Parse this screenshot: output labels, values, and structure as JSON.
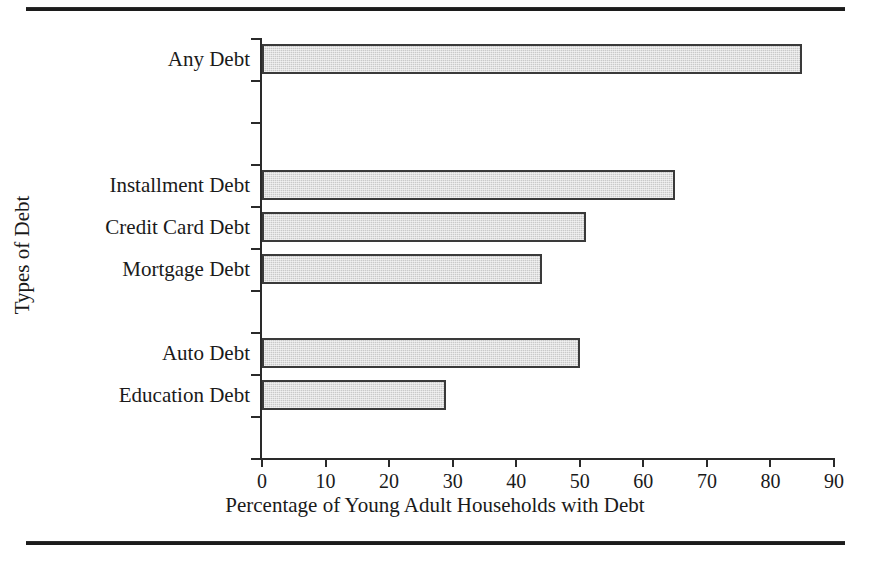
{
  "figure": {
    "top_rule": "",
    "bottom_rule": ""
  },
  "chart_data": {
    "type": "bar",
    "orientation": "horizontal",
    "title": "",
    "xlabel": "Percentage of Young Adult Households with Debt",
    "ylabel": "Types of Debt",
    "categories": [
      "Any Debt",
      "Installment Debt",
      "Credit Card Debt",
      "Mortgage Debt",
      "Auto Debt",
      "Education Debt"
    ],
    "values": [
      85,
      65,
      51,
      44,
      50,
      29
    ],
    "xlim": [
      0,
      90
    ],
    "xticks": [
      0,
      10,
      20,
      30,
      40,
      50,
      60,
      70,
      80,
      90
    ],
    "xtick_labels": [
      "0",
      "10",
      "20",
      "30",
      "40",
      "50",
      "60",
      "70",
      "80",
      "90"
    ],
    "grid": false,
    "legend": false,
    "bar_fill_color": "#c9c9c9",
    "bar_edge_color": "#3a3a3a",
    "axis_color": "#2a2a2a",
    "background_color": "#ffffff",
    "category_slots": [
      1,
      4,
      5,
      6,
      8,
      9
    ],
    "slot_count": 10
  }
}
